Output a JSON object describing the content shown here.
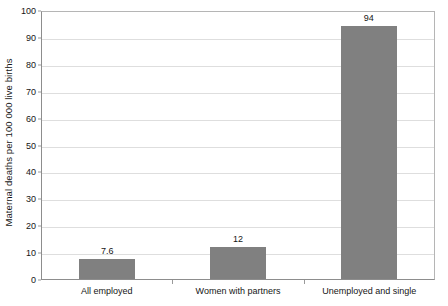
{
  "chart_data": {
    "type": "bar",
    "title": "",
    "xlabel": "",
    "ylabel": "Maternal deaths per 100 000 live births",
    "categories": [
      "All employed",
      "Women with partners",
      "Unemployed and single"
    ],
    "values": [
      7.6,
      12,
      94
    ],
    "value_labels": [
      "7.6",
      "12",
      "94"
    ],
    "ylim": [
      0,
      100
    ],
    "ytick_labels": [
      "0",
      "10",
      "20",
      "30",
      "40",
      "50",
      "60",
      "70",
      "80",
      "90",
      "100"
    ],
    "ytick_values": [
      0,
      10,
      20,
      30,
      40,
      50,
      60,
      70,
      80,
      90,
      100
    ],
    "grid": "horizontal",
    "legend": "none",
    "bar_color": "#808080",
    "gridline_color": "#dedede",
    "axis_color": "#8d8d8d",
    "background_color": "#ffffff"
  }
}
